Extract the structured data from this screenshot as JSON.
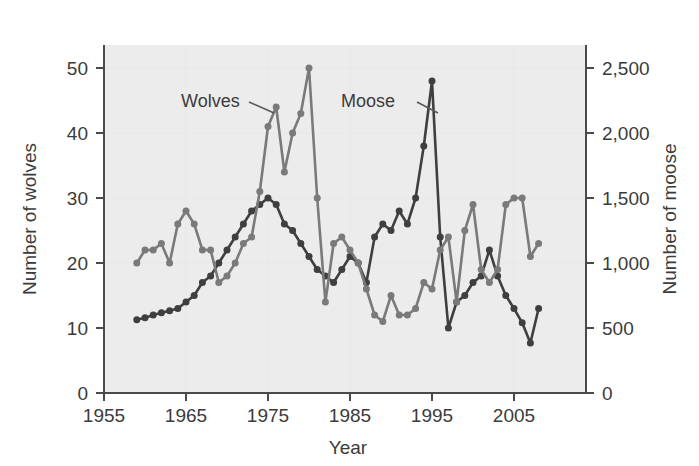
{
  "figure": {
    "background_color": "#ffffff",
    "plot_background_color": "#ececec",
    "gridline_color": "#e8e8e8",
    "axis_color": "#4a4a4a",
    "text_color": "#3b3b3b"
  },
  "labels": {
    "y_left_title": "Number of wolves",
    "y_right_title": "Number of moose",
    "x_title": "Year",
    "series_wolves": "Wolves",
    "series_moose": "Moose"
  },
  "axes": {
    "x_ticks": [
      "1955",
      "1965",
      "1975",
      "1985",
      "1995",
      "2005"
    ],
    "y_left_ticks": [
      "0",
      "10",
      "20",
      "30",
      "40",
      "50"
    ],
    "y_right_ticks": [
      "0",
      "500",
      "1,000",
      "1,500",
      "2,000",
      "2,500"
    ]
  },
  "chart_data": {
    "type": "line",
    "title": "",
    "subtitle": "",
    "xlabel": "Year",
    "ylabel": "Number of wolves",
    "y2label": "Number of moose",
    "xlim": [
      1955,
      2009
    ],
    "ylim": [
      0,
      55
    ],
    "y2lim": [
      0,
      2750
    ],
    "grid": true,
    "legend": "inline-annotations",
    "x_tick_values": [
      1955,
      1965,
      1975,
      1985,
      1995,
      2005
    ],
    "y_left_tick_values": [
      0,
      10,
      20,
      30,
      40,
      50
    ],
    "y_right_tick_values": [
      0,
      500,
      1000,
      1500,
      2000,
      2500
    ],
    "x": [
      1959,
      1960,
      1961,
      1962,
      1963,
      1964,
      1965,
      1966,
      1967,
      1968,
      1969,
      1970,
      1971,
      1972,
      1973,
      1974,
      1975,
      1976,
      1977,
      1978,
      1979,
      1980,
      1981,
      1982,
      1983,
      1984,
      1985,
      1986,
      1987,
      1988,
      1989,
      1990,
      1991,
      1992,
      1993,
      1994,
      1995,
      1996,
      1997,
      1998,
      1999,
      2000,
      2001,
      2002,
      2003,
      2004,
      2005,
      2006,
      2007,
      2008
    ],
    "series": [
      {
        "name": "Wolves",
        "color": "#7a7a7a",
        "axis": "left",
        "marker": "circle",
        "values": [
          20,
          22,
          22,
          23,
          20,
          26,
          28,
          26,
          22,
          22,
          17,
          18,
          20,
          23,
          24,
          31,
          41,
          44,
          34,
          40,
          43,
          50,
          30,
          14,
          23,
          24,
          22,
          20,
          16,
          12,
          11,
          15,
          12,
          12,
          13,
          17,
          16,
          22,
          24,
          14,
          25,
          29,
          19,
          17,
          19,
          29,
          30,
          30,
          21,
          23
        ]
      },
      {
        "name": "Moose",
        "color": "#3f3f3f",
        "axis": "right",
        "marker": "circle",
        "values": [
          563,
          578,
          600,
          617,
          633,
          650,
          700,
          750,
          850,
          900,
          1000,
          1100,
          1200,
          1300,
          1400,
          1450,
          1500,
          1450,
          1300,
          1250,
          1150,
          1050,
          950,
          900,
          850,
          950,
          1050,
          1000,
          850,
          1200,
          1300,
          1250,
          1400,
          1300,
          1500,
          1900,
          2400,
          1200,
          500,
          700,
          750,
          850,
          900,
          1100,
          900,
          750,
          650,
          540,
          385,
          650
        ]
      }
    ],
    "annotations": [
      {
        "text": "Wolves",
        "x": 1971,
        "y": 44,
        "points_to_x": 1976,
        "points_to_y": 44
      },
      {
        "text": "Moose",
        "x": 1987,
        "y": 44,
        "points_to_x": 1995,
        "points_to_y": 48
      }
    ]
  }
}
